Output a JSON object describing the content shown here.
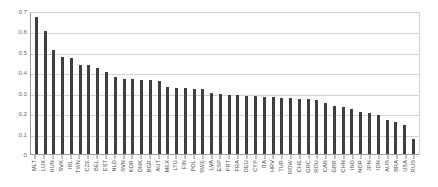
{
  "chart_data": {
    "type": "bar",
    "title": "",
    "subtitle": "",
    "xlabel": "",
    "ylabel": "",
    "ylim": [
      0,
      0.7
    ],
    "grid": true,
    "legend": null,
    "bar_color": "#3f3f3f",
    "yticks": [
      0,
      0.1,
      0.2,
      0.3,
      0.4,
      0.5,
      0.6,
      0.7
    ],
    "ytick_labels": [
      "0",
      "0.1",
      "0.2",
      "0.3",
      "0.4",
      "0.5",
      "0.6",
      "0.7"
    ],
    "categories": [
      "MLT",
      "LUX",
      "HUN",
      "SVK",
      "IRL",
      "TWN",
      "CZE",
      "BEL",
      "EST",
      "NLD",
      "SVN",
      "KOR",
      "DNK",
      "BGR",
      "AUT",
      "MEX",
      "LTU",
      "FIN",
      "POL",
      "SWE",
      "LVA",
      "ESP",
      "PRT",
      "FRA",
      "DEU",
      "CYP",
      "ITA",
      "HRV",
      "TUR",
      "ROW",
      "CHE",
      "GRC",
      "ROU",
      "CAN",
      "GBR",
      "CHN",
      "IND",
      "NOR",
      "JPN",
      "IDN",
      "AUS",
      "BRA",
      "USA",
      "RUS"
    ],
    "values": [
      0.67,
      0.6,
      0.51,
      0.475,
      0.468,
      0.437,
      0.435,
      0.423,
      0.4,
      0.375,
      0.368,
      0.366,
      0.362,
      0.36,
      0.358,
      0.33,
      0.325,
      0.322,
      0.32,
      0.318,
      0.3,
      0.296,
      0.29,
      0.288,
      0.284,
      0.282,
      0.28,
      0.278,
      0.275,
      0.272,
      0.27,
      0.268,
      0.266,
      0.25,
      0.237,
      0.23,
      0.22,
      0.205,
      0.2,
      0.19,
      0.165,
      0.155,
      0.14,
      0.075
    ]
  }
}
